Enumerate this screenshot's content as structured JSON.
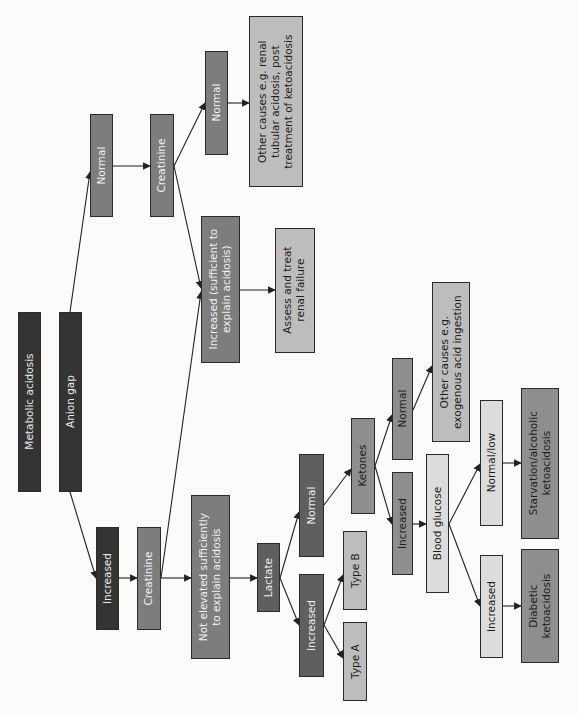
{
  "diagram": {
    "title": "Metabolic acidosis",
    "nodes": {
      "metabolic_acidosis": "Metabolic acidosis",
      "anion_gap": "Anion gap",
      "ag_normal": "Normal",
      "ag_increased": "Increased",
      "creat_upper": "Creatinine",
      "creat_upper_normal": "Normal",
      "creat_upper_increased": "Increased (sufficient to\nexplain acidosis)",
      "other_causes_rta": "Other causes e.g. renal\ntubular acidosis, post\ntreatment of ketoacidosis",
      "assess_renal": "Assess and treat\nrenal failure",
      "creat_lower": "Creatinine",
      "not_elevated": "Not elevated sufficiently\nto explain acidosis",
      "lactate": "Lactate",
      "lactate_normal": "Normal",
      "lactate_increased": "Increased",
      "type_a": "Type A",
      "type_b": "Type B",
      "ketones": "Ketones",
      "ketones_normal": "Normal",
      "ketones_increased": "Increased",
      "other_causes_exog": "Other causes e.g.\nexogenous acid ingestion",
      "blood_glucose": "Blood glucose",
      "glucose_normal_low": "Normal/low",
      "glucose_increased": "Increased",
      "starvation": "Starvation/alcoholic\nketoacidosis",
      "diabetic": "Diabetic\nketoacidosis"
    },
    "colors": {
      "black": "#343434",
      "dark": "#5f5f5f",
      "mid": "#7d7d7d",
      "light": "#bdbdbd",
      "pale": "#dcdcdc",
      "line": "#222222"
    }
  }
}
